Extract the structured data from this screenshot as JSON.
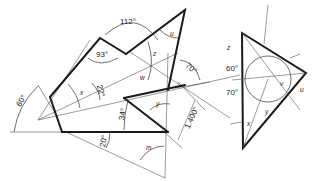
{
  "diagram": {
    "left_figure": {
      "angle_labels": {
        "a112": "112°",
        "a93": "93°",
        "a70": "70°",
        "a60": "60°",
        "a22": "22°",
        "a34": "34°",
        "a20": "20°"
      },
      "variable_labels": {
        "u": "u",
        "z": "z",
        "x": "x",
        "y": "y",
        "w": "w",
        "m": "m"
      },
      "dimension_label": "1.400\""
    },
    "right_figure": {
      "angle_labels": {
        "a60": "60°",
        "a70": "70°"
      },
      "variable_labels": {
        "z": "z",
        "u": "u",
        "v": "v",
        "x": "x",
        "y": "y"
      }
    }
  }
}
